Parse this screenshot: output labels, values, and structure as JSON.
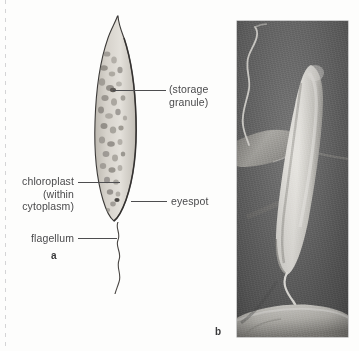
{
  "figure": {
    "type": "biology-figure",
    "panels": [
      {
        "letter": "a",
        "kind": "light-micrograph-drawing"
      },
      {
        "letter": "b",
        "kind": "scanning-electron-micrograph"
      }
    ]
  },
  "panel_a": {
    "letter": "a",
    "labels": {
      "storage_granule": "(storage\ngranule)",
      "storage_granule_line1": "(storage",
      "storage_granule_line2": "granule)",
      "chloroplast": "chloroplast\n(within\ncytoplasm)",
      "chloroplast_line1": "chloroplast",
      "chloroplast_line2": "(within",
      "chloroplast_line3": "cytoplasm)",
      "eyespot": "eyespot",
      "flagellum": "flagellum"
    }
  },
  "panel_b": {
    "letter": "b"
  },
  "colors": {
    "page_background": "#fdfdfc",
    "label_text": "#4a4a4c",
    "leader_line": "#4d4d4f",
    "cell_outline": "#3c3a38",
    "cell_fill": "#cfcbc4",
    "micrograph_background": "#6d6d6d",
    "micrograph_cell": "#d9d7d2"
  }
}
